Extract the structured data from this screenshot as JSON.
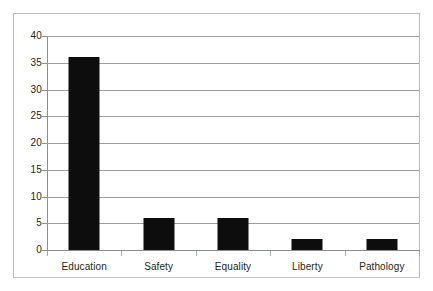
{
  "chart_data": {
    "type": "bar",
    "title": "",
    "subtitle": "",
    "xlabel": "",
    "ylabel": "",
    "categories": [
      "Education",
      "Safety",
      "Equality",
      "Liberty",
      "Pathology"
    ],
    "values": [
      36,
      6,
      6,
      2,
      2
    ],
    "ylim": [
      0,
      40
    ],
    "ytick_step": 5,
    "ytick_labels": [
      "40",
      "35",
      "30",
      "25",
      "20",
      "15",
      "10",
      "5",
      "0"
    ],
    "ytick_values": [
      40,
      35,
      30,
      25,
      20,
      15,
      10,
      5,
      0
    ],
    "grid": "horizontal",
    "legend": "none",
    "series": [
      {
        "name": "",
        "values": [
          36,
          6,
          6,
          2,
          2
        ],
        "color": "#0d0d0d"
      }
    ],
    "annotations": []
  },
  "colors": {
    "bar": "#0d0d0d",
    "gridline": "#9a9ea2",
    "axis": "#8a8e92",
    "frame_border": "#b8bcc0",
    "plot_background": "#ffffff",
    "text": "#231f20"
  }
}
